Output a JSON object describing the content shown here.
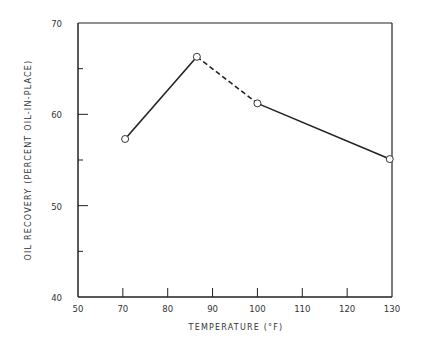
{
  "chart_data": {
    "type": "line",
    "title": "",
    "xlabel": "TEMPERATURE (°F)",
    "ylabel": "OIL RECOVERY (PERCENT OIL-IN-PLACE)",
    "xlim": [
      60,
      130
    ],
    "ylim": [
      40,
      70
    ],
    "x_tick_labels": [
      "50",
      "70",
      "80",
      "90",
      "100",
      "110",
      "120",
      "130"
    ],
    "y_tick_labels": [
      "40",
      "50",
      "60",
      "70"
    ],
    "grid": false,
    "series": [
      {
        "name": "Oil recovery",
        "marker": "open-circle",
        "x": [
          70.5,
          86.5,
          100,
          129.5
        ],
        "y": [
          57.3,
          66.3,
          61.2,
          55.1
        ],
        "segment_styles": [
          "solid",
          "dashed",
          "solid"
        ]
      }
    ]
  }
}
